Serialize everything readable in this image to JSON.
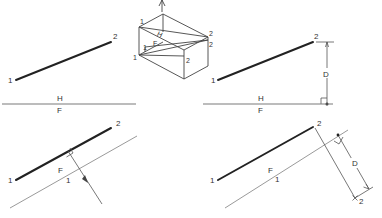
{
  "figure": {
    "panels": {
      "top_left": {
        "point_labels": [
          "1",
          "2"
        ],
        "fold_labels": {
          "above": "H",
          "below": "F"
        }
      },
      "pictorial": {
        "labels": [
          "1",
          "1",
          "H",
          "F",
          "1",
          "2",
          "2",
          "2"
        ]
      },
      "top_right": {
        "point_labels": [
          "1",
          "2"
        ],
        "dimension_label": "D",
        "fold_labels": {
          "above": "H",
          "below": "F"
        }
      },
      "bottom_left": {
        "point_labels": [
          "1",
          "2"
        ],
        "fold_labels": {
          "above": "F",
          "below": "1"
        }
      },
      "bottom_right": {
        "point_labels": [
          "1",
          "2"
        ],
        "projected_point_label": "2",
        "dimension_label": "D",
        "fold_labels": {
          "above": "F",
          "below": "1"
        }
      }
    }
  }
}
